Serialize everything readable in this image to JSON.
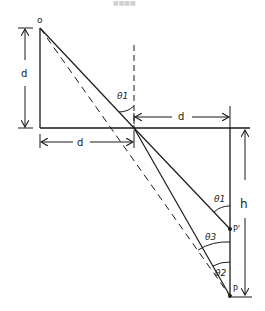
{
  "header": {
    "text": "■■■■"
  },
  "labels": {
    "origin": "o",
    "d_vertical": "d",
    "d_top": "d",
    "d_bottom": "d",
    "theta1_top": "θ1",
    "theta1_bottom": "θ1",
    "theta2": "θ2",
    "theta3": "θ3",
    "p_prime": "P'",
    "p": "P",
    "h": "h"
  },
  "colors": {
    "line": "#1a1a1a",
    "background": "#ffffff"
  }
}
